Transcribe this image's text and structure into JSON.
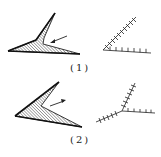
{
  "figures": [
    {
      "id": "fig-1",
      "caption": "(1)",
      "left_shape": "hatched-wedge-with-arrow",
      "right_shape": "ticked-v-lines"
    },
    {
      "id": "fig-2",
      "caption": "(2)",
      "left_shape": "hatched-arrowhead-with-arrow",
      "right_shape": "ticked-y-junction"
    }
  ],
  "colors": {
    "ink": "#222222",
    "background": "#ffffff"
  }
}
